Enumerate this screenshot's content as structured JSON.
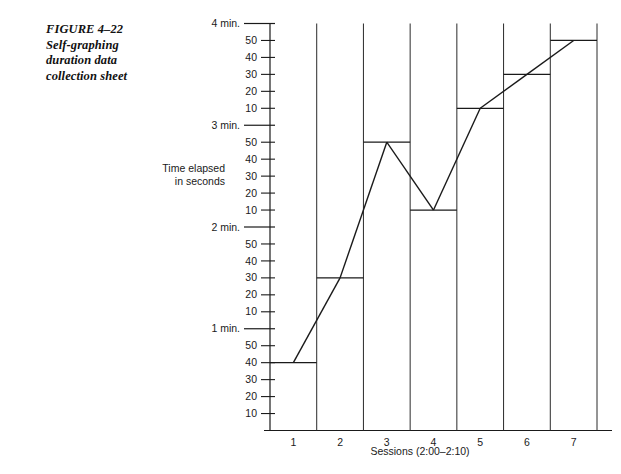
{
  "figure": {
    "label": "FIGURE 4–22",
    "title_line1": "Self-graphing",
    "title_line2": "duration data",
    "title_line3": "collection sheet"
  },
  "axis": {
    "y_title_line1": "Time elapsed",
    "y_title_line2": "in seconds",
    "x_title": "Sessions (2:00–2:10)"
  },
  "chart_data": {
    "type": "line",
    "title": "Self-graphing duration data collection sheet",
    "xlabel": "Sessions (2:00–2:10)",
    "ylabel": "Time elapsed in seconds",
    "grid": "vertical-session-columns",
    "legend": "none",
    "categories": [
      "1",
      "2",
      "3",
      "4",
      "5",
      "6",
      "7"
    ],
    "values_seconds": [
      40,
      90,
      170,
      130,
      190,
      210,
      230
    ],
    "values_formatted": [
      "40 sec",
      "1 min. 30 sec",
      "2 min. 50 sec",
      "2 min. 10 sec",
      "3 min. 10 sec",
      "3 min. 30 sec",
      "3 min. 50 sec"
    ],
    "ylim_seconds": [
      0,
      240
    ],
    "y_tick_interval_seconds": 10,
    "y_minute_labels": [
      "1 min.",
      "2 min.",
      "3 min.",
      "4 min."
    ],
    "y_minute_values_seconds": [
      60,
      120,
      180,
      240
    ],
    "y_second_tick_labels": [
      "10",
      "20",
      "30",
      "40",
      "50"
    ],
    "marker_style": "horizontal bar spanning session column",
    "colors": {
      "ink": "#1a1a1a",
      "background": "#ffffff"
    }
  },
  "y_ticks": [
    {
      "label": "4 min.",
      "seconds": 240,
      "major": true
    },
    {
      "label": "50",
      "seconds": 230,
      "major": false
    },
    {
      "label": "40",
      "seconds": 220,
      "major": false
    },
    {
      "label": "30",
      "seconds": 210,
      "major": false
    },
    {
      "label": "20",
      "seconds": 200,
      "major": false
    },
    {
      "label": "10",
      "seconds": 190,
      "major": false
    },
    {
      "label": "3 min.",
      "seconds": 180,
      "major": true
    },
    {
      "label": "50",
      "seconds": 170,
      "major": false
    },
    {
      "label": "40",
      "seconds": 160,
      "major": false
    },
    {
      "label": "30",
      "seconds": 150,
      "major": false
    },
    {
      "label": "20",
      "seconds": 140,
      "major": false
    },
    {
      "label": "10",
      "seconds": 130,
      "major": false
    },
    {
      "label": "2 min.",
      "seconds": 120,
      "major": true
    },
    {
      "label": "50",
      "seconds": 110,
      "major": false
    },
    {
      "label": "40",
      "seconds": 100,
      "major": false
    },
    {
      "label": "30",
      "seconds": 90,
      "major": false
    },
    {
      "label": "20",
      "seconds": 80,
      "major": false
    },
    {
      "label": "10",
      "seconds": 70,
      "major": false
    },
    {
      "label": "1 min.",
      "seconds": 60,
      "major": true
    },
    {
      "label": "50",
      "seconds": 50,
      "major": false
    },
    {
      "label": "40",
      "seconds": 40,
      "major": false
    },
    {
      "label": "30",
      "seconds": 30,
      "major": false
    },
    {
      "label": "20",
      "seconds": 20,
      "major": false
    },
    {
      "label": "10",
      "seconds": 10,
      "major": false
    }
  ]
}
